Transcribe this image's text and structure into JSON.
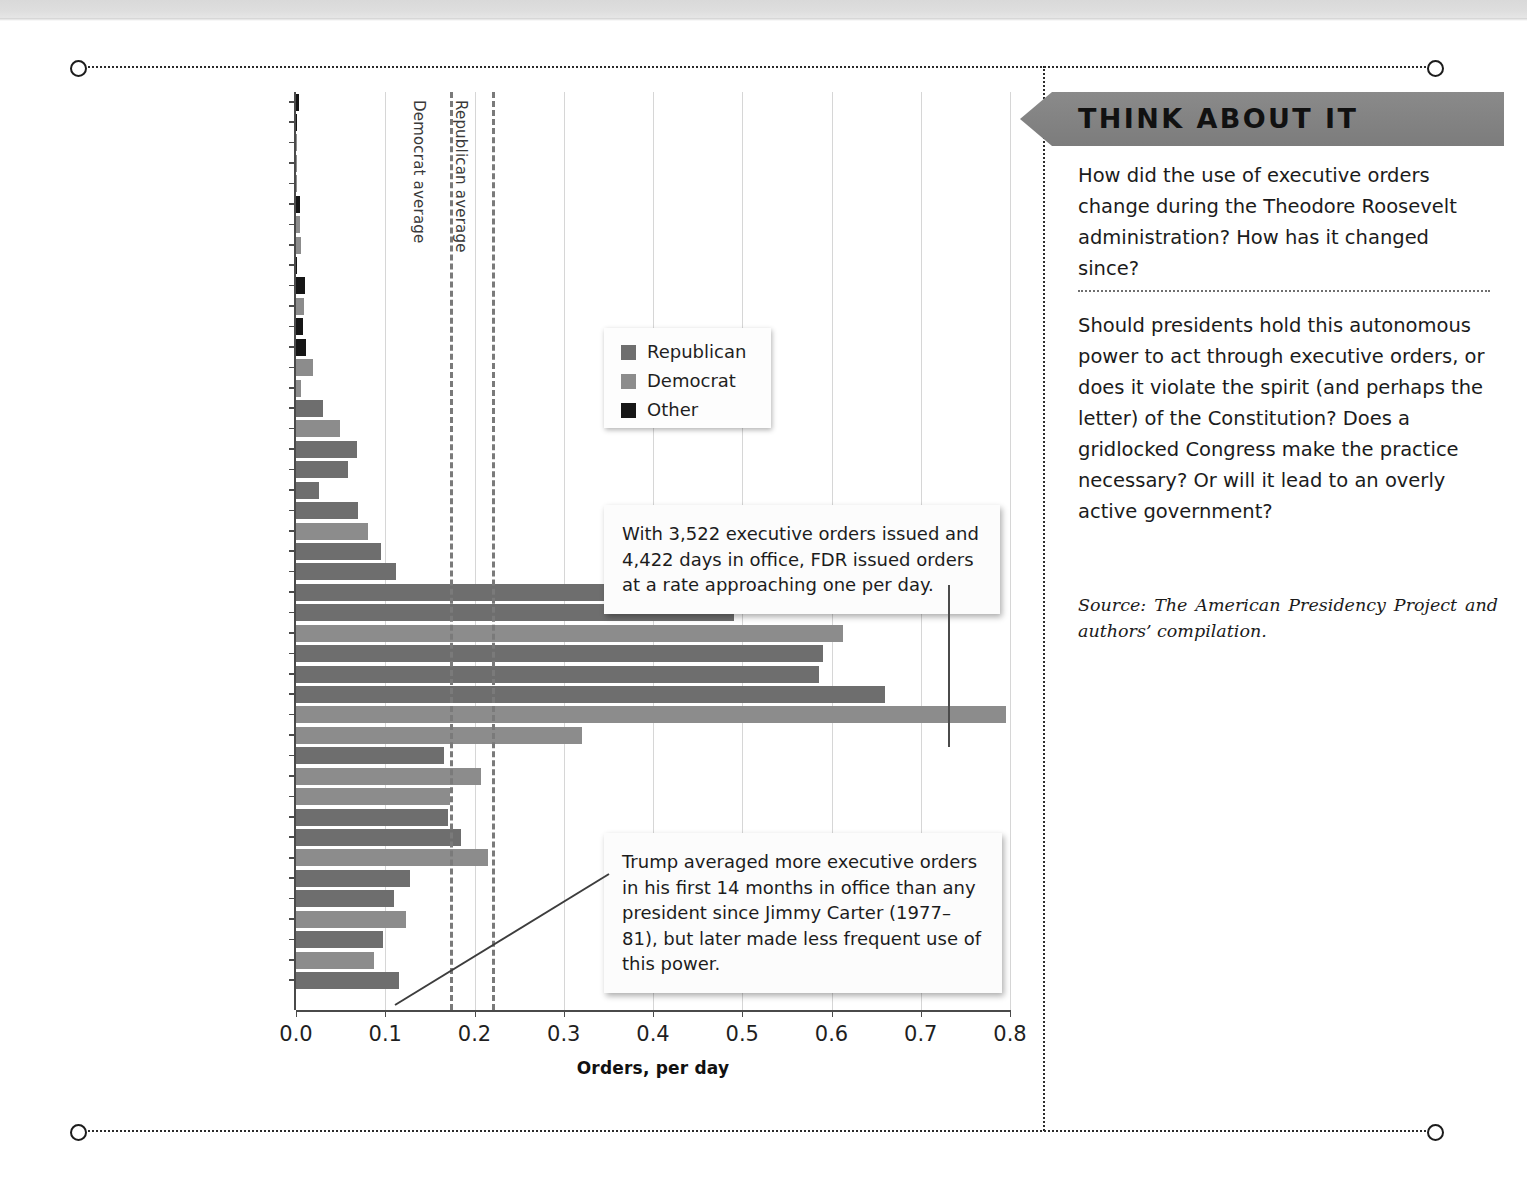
{
  "chart_data": {
    "type": "bar",
    "orientation": "horizontal",
    "title": "",
    "xlabel": "Orders, per day",
    "ylabel": "",
    "xlim": [
      0,
      0.8
    ],
    "xticks": [
      "0.0",
      "0.1",
      "0.2",
      "0.3",
      "0.4",
      "0.5",
      "0.6",
      "0.7",
      "0.8"
    ],
    "grid": true,
    "legend_position": "upper-center",
    "legend": [
      {
        "label": "Republican",
        "color": "#6e6e6e"
      },
      {
        "label": "Democrat",
        "color": "#8c8c8c"
      },
      {
        "label": "Other",
        "color": "#161616"
      }
    ],
    "reference_lines": [
      {
        "label": "Democrat average",
        "value": 0.172
      },
      {
        "label": "Republican average",
        "value": 0.22
      }
    ],
    "categories": [
      "George Washington",
      "John Adams",
      "Thomas Jefferson",
      "James Madison",
      "James Monroe",
      "John Q. Adams",
      "Andrew Jackson",
      "Martin Van Buren",
      "William H. Harrison",
      "John Tyler",
      "James K. Polk",
      "Zachary Taylor",
      "Millard Fillmore",
      "Franklin Pierce",
      "James Buchanan",
      "Abraham Lincoln",
      "Andrew Johnson",
      "Ulysses Grant",
      "Rutherford Hayes",
      "James Garfield",
      "Chester Arthur",
      "Grover Cleveland",
      "Benjamin Harrison",
      "William McKinley",
      "Theodore Roosevelt",
      "William H. Taft",
      "Woodrow Wilson",
      "Warren Harding",
      "Calvin Coolidge",
      "Herbert Hoover",
      "Franklin D. Roosevelt",
      "Harry Truman",
      "Dwight D. Eisenhower",
      "John F. Kennedy",
      "Lyndon B. Johnson",
      "Richard Nixon",
      "Gerald Ford",
      "Jimmy Carter",
      "Ronald Reagan",
      "George H.W. Bush",
      "Bill Clinton",
      "George W. Bush",
      "Barack Obama",
      "Donald Trump"
    ],
    "values": [
      0.003,
      0.001,
      0.001,
      0.001,
      0.001,
      0.005,
      0.004,
      0.006,
      0.001,
      0.01,
      0.009,
      0.008,
      0.011,
      0.019,
      0.006,
      0.03,
      0.049,
      0.068,
      0.058,
      0.026,
      0.07,
      0.081,
      0.095,
      0.112,
      0.393,
      0.491,
      0.613,
      0.59,
      0.586,
      0.66,
      0.796,
      0.32,
      0.166,
      0.207,
      0.172,
      0.17,
      0.185,
      0.215,
      0.128,
      0.11,
      0.123,
      0.098,
      0.087,
      0.115
    ],
    "party": [
      "Other",
      "Other",
      "Democrat",
      "Democrat",
      "Democrat",
      "Other",
      "Democrat",
      "Democrat",
      "Other",
      "Other",
      "Democrat",
      "Other",
      "Other",
      "Democrat",
      "Democrat",
      "Republican",
      "Democrat",
      "Republican",
      "Republican",
      "Republican",
      "Republican",
      "Democrat",
      "Republican",
      "Republican",
      "Republican",
      "Republican",
      "Democrat",
      "Republican",
      "Republican",
      "Republican",
      "Democrat",
      "Democrat",
      "Republican",
      "Democrat",
      "Democrat",
      "Republican",
      "Republican",
      "Democrat",
      "Republican",
      "Republican",
      "Democrat",
      "Republican",
      "Democrat",
      "Republican"
    ]
  },
  "callouts": {
    "fdr": "With 3,522 executive orders issued and 4,422 days in office, FDR issued orders at a rate approaching one per day.",
    "trump": "Trump averaged more executive orders in his first 14 months in office than any president since Jimmy Carter (1977–81), but later made less frequent use of this power."
  },
  "sidebar": {
    "title": "THINK ABOUT IT",
    "question_1": "How did the use of executive orders change during the Theodore Roosevelt administration? How has it changed since?",
    "question_2": "Should presidents hold this autonomous power to act through executive orders, or does it violate the spirit (and perhaps the letter) of the Constitution? Does a gridlocked Congress make the practice necessary? Or will it lead to an overly active government?",
    "source": "Source: The American Presidency Project and authors’ compilation."
  }
}
